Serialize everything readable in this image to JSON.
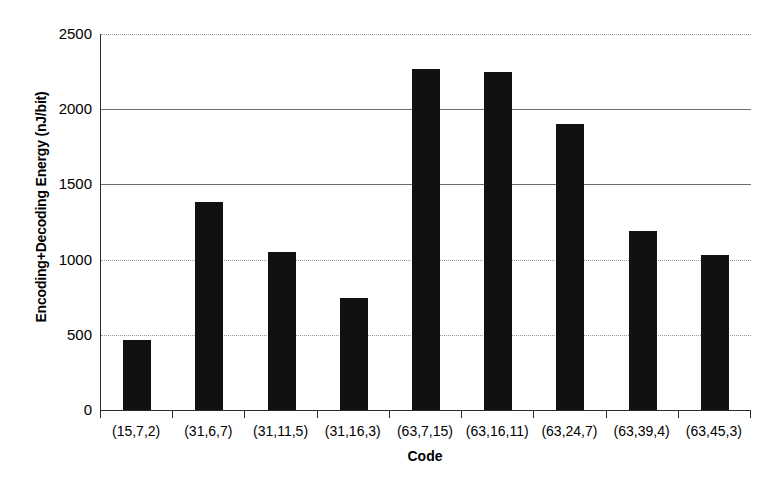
{
  "chart_data": {
    "type": "bar",
    "title": "",
    "xlabel": "Code",
    "ylabel": "Encoding+Decoding Energy (nJ/bit)",
    "categories": [
      "(15,7,2)",
      "(31,6,7)",
      "(31,11,5)",
      "(31,16,3)",
      "(63,7,15)",
      "(63,16,11)",
      "(63,24,7)",
      "(63,39,4)",
      "(63,45,3)"
    ],
    "values": [
      465,
      1380,
      1050,
      745,
      2265,
      2245,
      1900,
      1190,
      1030
    ],
    "ylim": [
      0,
      2500
    ],
    "yticks": [
      0,
      500,
      1000,
      1500,
      2000,
      2500
    ],
    "ytick_labels": [
      "0",
      "500",
      "1000",
      "1500",
      "2000",
      "2500"
    ],
    "grid": true,
    "legend": "none",
    "bar_color": "#111111",
    "series": [
      {
        "name": "Encoding+Decoding Energy",
        "values": [
          465,
          1380,
          1050,
          745,
          2265,
          2245,
          1900,
          1190,
          1030
        ]
      }
    ]
  }
}
